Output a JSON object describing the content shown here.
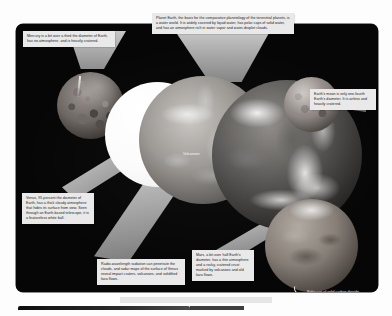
{
  "figure": {
    "title": "Comparative planetology of the terrestrial planets",
    "plate_background": "#060606",
    "callout_background": "#e9e9e9"
  },
  "callouts": [
    {
      "id": "mercury",
      "name": "Mercury",
      "text": "Mercury is a bit over a third the diameter of Earth, has no atmosphere, and is heavily cratered."
    },
    {
      "id": "earth",
      "name": "Planet Earth",
      "text": "Planet Earth, the basis for the comparative planetology of the terrestrial planets, is a water world. It is widely covered by liquid water, has polar caps of solid water, and has an atmosphere rich in water vapor and water-droplet clouds."
    },
    {
      "id": "moon",
      "name": "Earth's moon",
      "text": "Earth's moon is only one-fourth Earth's diameter. It is airless and heavily cratered."
    },
    {
      "id": "venus",
      "name": "Venus",
      "text": "Venus, 95 percent the diameter of Earth, has a thick cloudy atmosphere that hides its surface from view. Seen through an Earth-based telescope, it is a featureless white ball."
    },
    {
      "id": "radio",
      "name": "Radio-wavelength radar mapping",
      "text": "Radio-wavelength radiation can penetrate the clouds, and radar maps of the surface of Venus reveal impact craters, volcanoes, and solidified lava flows."
    },
    {
      "id": "mars",
      "name": "Mars",
      "text": "Mars, a bit over half Earth's diameter, has a thin atmosphere and a rocky, cratered crust marked by volcanoes and old lava flows."
    }
  ],
  "labels": {
    "volcanoes": "Volcanoes",
    "polar_cap": "Polar cap of solid carbon dioxide"
  },
  "bodies": [
    {
      "id": "mercury",
      "label": "Mercury"
    },
    {
      "id": "venus-white",
      "label": "Venus (visible light, featureless white ball)"
    },
    {
      "id": "venus-radar",
      "label": "Venus (radar map)"
    },
    {
      "id": "earth",
      "label": "Earth"
    },
    {
      "id": "moon",
      "label": "Moon"
    },
    {
      "id": "mars",
      "label": "Mars"
    }
  ]
}
